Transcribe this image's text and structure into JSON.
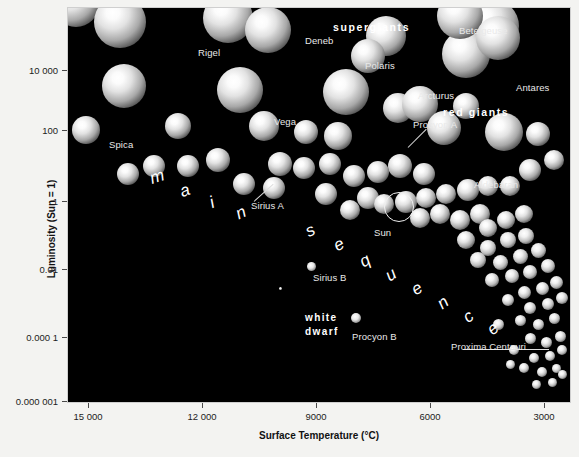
{
  "chart_data": {
    "type": "scatter",
    "xlabel": "Surface Temperature (°C)",
    "ylabel": "Luminosity (Sun = 1)",
    "xticks": [
      "15 000",
      "12 000",
      "9000",
      "6000",
      "3000"
    ],
    "xtick_values": [
      15000,
      12000,
      9000,
      6000,
      3000
    ],
    "yticks": [
      "10 000",
      "100",
      "1",
      "0.01",
      "0.000 1",
      "0.000 001"
    ],
    "ytick_values": [
      10000,
      100,
      1,
      0.01,
      0.0001,
      1e-06
    ],
    "xlim": [
      15800,
      1900
    ],
    "ylim": [
      1e-06,
      1000000
    ],
    "yscale": "log",
    "x_axis_direction": "decreasing",
    "grid": false,
    "legend": null,
    "background": "#000000",
    "region_labels": [
      {
        "text": "supergiants",
        "x": 333,
        "y": 22,
        "style": "bold"
      },
      {
        "text": "red giants",
        "x": 443,
        "y": 107,
        "style": "bold"
      },
      {
        "text": "white",
        "x": 305,
        "y": 313,
        "style": "bold2"
      },
      {
        "text": "dwarf",
        "x": 305,
        "y": 327,
        "style": "bold2"
      }
    ],
    "diagonal_label": {
      "text": "main sequence",
      "letters": [
        "m",
        "a",
        "i",
        "n",
        "s",
        "e",
        "q",
        "u",
        "e",
        "n",
        "c",
        "e"
      ]
    },
    "star_labels": [
      {
        "name": "Rigel",
        "x": 198,
        "y": 48
      },
      {
        "name": "Deneb",
        "x": 305,
        "y": 36
      },
      {
        "name": "Betelgeuse",
        "x": 459,
        "y": 26
      },
      {
        "name": "Polaris",
        "x": 365,
        "y": 61
      },
      {
        "name": "Antares",
        "x": 516,
        "y": 83
      },
      {
        "name": "Arcturus",
        "x": 418,
        "y": 91
      },
      {
        "name": "Spica",
        "x": 109,
        "y": 140
      },
      {
        "name": "Vega",
        "x": 274,
        "y": 117
      },
      {
        "name": "Procyon A",
        "x": 413,
        "y": 120
      },
      {
        "name": "Aldebaran",
        "x": 474,
        "y": 180
      },
      {
        "name": "Sirius A",
        "x": 251,
        "y": 201
      },
      {
        "name": "Sun",
        "x": 374,
        "y": 228
      },
      {
        "name": "Sirius B",
        "x": 313,
        "y": 273
      },
      {
        "name": "Procyon B",
        "x": 352,
        "y": 332
      },
      {
        "name": "Proxima Centauri",
        "x": 451,
        "y": 342
      }
    ],
    "highlighted_star": {
      "name": "Sun",
      "cx": 398,
      "cy": 206,
      "radius": 14
    }
  },
  "axes": {
    "y_title": "Luminosity (Sun = 1)",
    "x_title": "Surface Temperature (°C)",
    "y_labels": [
      "10 000",
      "100",
      "1",
      "0.01",
      "0.000 1",
      "0.000 001"
    ],
    "x_labels": [
      "15 000",
      "12 000",
      "9000",
      "6000",
      "3000"
    ]
  },
  "colors": {
    "plot_background": "#000000",
    "page_background": "#f3f3f1",
    "star_core": "#ffffff",
    "label_text": "#e9e9e9",
    "axis_text": "#1c1c1c",
    "highlight_ring": "#f0f0f0"
  },
  "icons": {
    "star_glyph": "star-icon",
    "highlight_ring": "circle-highlight-icon",
    "leader_line": "leader-line-icon"
  }
}
